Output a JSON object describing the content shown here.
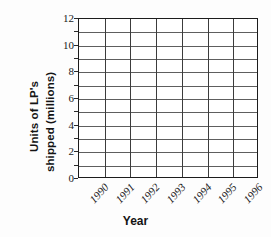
{
  "chart_data": {
    "type": "bar",
    "title": "",
    "subtitle": "",
    "xlabel": "Year",
    "ylabel": "Units of LP's shipped (millions)",
    "ylabel_lines": [
      "Units of LP's",
      "shipped (millions)"
    ],
    "categories": [
      "1990",
      "1991",
      "1992",
      "1993",
      "1994",
      "1995",
      "1996"
    ],
    "values": [
      null,
      null,
      null,
      null,
      null,
      null,
      null
    ],
    "series": [],
    "ylim": [
      0,
      12
    ],
    "ytick_step": 2,
    "ytick_labels": [
      "0",
      "2",
      "4",
      "6",
      "8",
      "10",
      "12"
    ],
    "ygrid_step": 1,
    "grid": true,
    "legend": "none",
    "note": "blank plotting grid - no data plotted",
    "colors": {
      "background": "#fdfdfd",
      "plot_background": "#ffffff",
      "frame": "#1c1c1c",
      "hgrid": "#5e5e5e",
      "vgrid": "#3c3c3c",
      "text": "#1a1a1a"
    }
  },
  "axis": {
    "x_title": "Year",
    "y_title_line_1": "Units of LP's",
    "y_title_line_2": "shipped (millions)"
  }
}
